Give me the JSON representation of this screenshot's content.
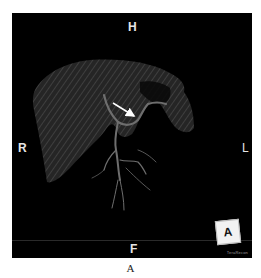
{
  "figure": {
    "caption": "A",
    "image_kind": "3D volume rendering of liver with biliary/vascular tree",
    "background_color": "#000000",
    "orientation_labels": {
      "top": "H",
      "bottom": "F",
      "left": "R",
      "right": "L"
    },
    "orientation_cube": {
      "label": "A"
    },
    "watermark": "TeraRecon",
    "annotation": {
      "type": "arrow",
      "color": "#ffffff",
      "from": [
        113,
        103
      ],
      "to": [
        136,
        117
      ]
    }
  }
}
